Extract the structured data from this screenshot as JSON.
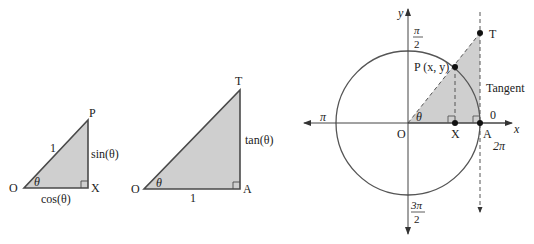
{
  "colors": {
    "fill": "#cfcfcf",
    "stroke": "#4a4a4a",
    "text": "#222222",
    "background": "#ffffff"
  },
  "triangle_sin_cos": {
    "vertices": {
      "O": "O",
      "X": "X",
      "P": "P"
    },
    "hypotenuse": "1",
    "opposite": "sin(θ)",
    "adjacent": "cos(θ)",
    "angle": "θ"
  },
  "triangle_tan": {
    "vertices": {
      "O": "O",
      "A": "A",
      "T": "T"
    },
    "adjacent": "1",
    "opposite": "tan(θ)",
    "angle": "θ"
  },
  "unit_circle": {
    "axis_x": "x",
    "axis_y": "y",
    "origin": "O",
    "point_p": "P (x, y)",
    "point_x": "X",
    "point_a": "A",
    "point_t": "T",
    "angle": "θ",
    "tangent_label": "Tangent",
    "angle_marks": {
      "zero": "0",
      "two_pi": "2π",
      "pi": "π",
      "half_pi_num": "π",
      "half_pi_den": "2",
      "three_half_pi_num": "3π",
      "three_half_pi_den": "2"
    }
  }
}
